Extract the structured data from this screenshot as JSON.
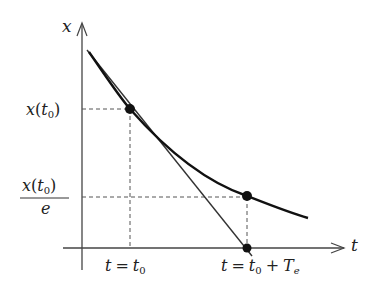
{
  "diagram": {
    "type": "exponential-decay-time-constant",
    "axes": {
      "x_axis_label": "t",
      "y_axis_label": "x"
    },
    "y_labels": {
      "x_t0": {
        "base": "x",
        "open": "(",
        "var": "t",
        "sub": "0",
        "close": ")"
      },
      "x_t0_over_e": {
        "numerator_base": "x",
        "open": "(",
        "var": "t",
        "sub": "0",
        "close": ")",
        "denominator": "e"
      }
    },
    "x_labels": {
      "t0": {
        "lhs": "t",
        "eq": "=",
        "rhs_var": "t",
        "rhs_sub": "0"
      },
      "t0_plus_Te": {
        "lhs": "t",
        "eq": "=",
        "rhs_var": "t",
        "rhs_sub": "0",
        "plus": "+",
        "T": "T",
        "T_sub": "e"
      }
    },
    "points": [
      {
        "name": "x(t0)",
        "x": 130,
        "y": 109
      },
      {
        "name": "x(t0)/e",
        "x": 247,
        "y": 196
      },
      {
        "name": "t0+Te",
        "x": 247,
        "y": 248
      }
    ],
    "colors": {
      "curve": "#111111",
      "axis": "#444444",
      "dashed": "#555555",
      "tangent": "#333333"
    }
  }
}
